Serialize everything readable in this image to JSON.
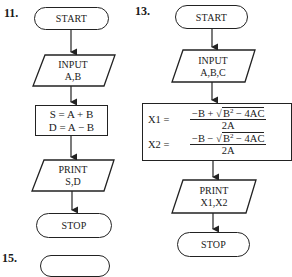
{
  "diagrams": [
    {
      "number": "11.",
      "nodes": {
        "start": "START",
        "input_title": "INPUT",
        "input_vars": "A,B",
        "process_line1": "S = A + B",
        "process_line2": "D = A − B",
        "print_title": "PRINT",
        "print_vars": "S,D",
        "stop": "STOP"
      }
    },
    {
      "number": "13.",
      "nodes": {
        "start": "START",
        "input_title": "INPUT",
        "input_vars": "A,B,C",
        "x1_lhs": "X1 =",
        "x1_num_left": "−B + ",
        "x1_num_sqrt": "B",
        "x1_num_sq": "2",
        "x1_num_right": " − 4AC",
        "x1_den": "2A",
        "x2_lhs": "X2 =",
        "x2_num_left": "−B − ",
        "x2_num_sqrt": "B",
        "x2_num_sq": "2",
        "x2_num_right": " − 4AC",
        "x2_den": "2A",
        "print_title": "PRINT",
        "print_vars": "X1,X2",
        "stop": "STOP"
      }
    },
    {
      "number": "15."
    }
  ]
}
